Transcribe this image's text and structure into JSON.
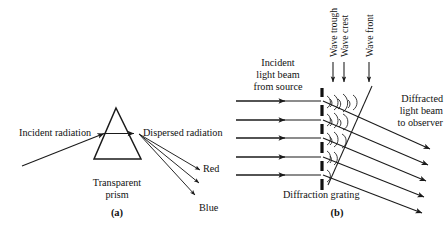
{
  "figure": {
    "title_visible": false,
    "background": "#ffffff",
    "ink": "#1a1a1a",
    "width": 445,
    "height": 230
  },
  "panel_a": {
    "tag": "(a)",
    "incident_label": "Incident radiation",
    "dispersed_label": "Dispersed radiation",
    "prism_label_line1": "Transparent",
    "prism_label_line2": "prism",
    "red_label": "Red",
    "blue_label": "Blue",
    "prism": {
      "apex_x": 116,
      "apex_y": 108,
      "base_left_x": 94,
      "base_right_x": 141,
      "base_y": 159
    },
    "incident_ray": {
      "x1": 22,
      "y1": 166,
      "x2": 106,
      "y2": 133
    },
    "internal_ray": {
      "x1": 106,
      "y1": 133,
      "x2": 136,
      "y2": 133
    },
    "dispersed_rays": [
      {
        "x1": 138,
        "y1": 134,
        "x2": 203,
        "y2": 172,
        "name": "red-ray"
      },
      {
        "x1": 138,
        "y1": 134,
        "x2": 202,
        "y2": 185,
        "name": "middle-ray"
      },
      {
        "x1": 138,
        "y1": 134,
        "x2": 198,
        "y2": 197,
        "name": "blue-ray"
      }
    ]
  },
  "panel_b": {
    "tag": "(b)",
    "incident_beam_label_lines": [
      "Incident",
      "light beam",
      "from source"
    ],
    "diffracted_beam_label_lines": [
      "Diffracted",
      "light beam",
      "to observer"
    ],
    "grating_label": "Diffraction grating",
    "callouts": [
      {
        "text": "Wave trough",
        "arrow_x": 333,
        "arrow_top_y": 62,
        "arrow_bottom_y": 84
      },
      {
        "text": "Wave crest",
        "arrow_x": 344,
        "arrow_top_y": 62,
        "arrow_bottom_y": 84
      },
      {
        "text": "Wave front",
        "arrow_x": 369,
        "arrow_top_y": 62,
        "arrow_bottom_y": 84
      }
    ],
    "grating": {
      "x": 322,
      "top_y": 88,
      "bottom_y": 190,
      "segments": 6
    },
    "incident_rays_y": [
      101,
      120,
      138,
      157,
      175
    ],
    "incident_ray_x_start": 236,
    "incident_ray_x_end": 321,
    "diffracted_rays": [
      {
        "x1": 323,
        "y1": 101,
        "x2": 432,
        "y2": 150
      },
      {
        "x1": 323,
        "y1": 120,
        "x2": 430,
        "y2": 166
      },
      {
        "x1": 323,
        "y1": 138,
        "x2": 428,
        "y2": 182
      },
      {
        "x1": 323,
        "y1": 157,
        "x2": 426,
        "y2": 198
      },
      {
        "x1": 323,
        "y1": 175,
        "x2": 424,
        "y2": 214
      }
    ],
    "wavefront_line": {
      "x1": 372,
      "y1": 86,
      "x2": 327,
      "y2": 186
    }
  }
}
